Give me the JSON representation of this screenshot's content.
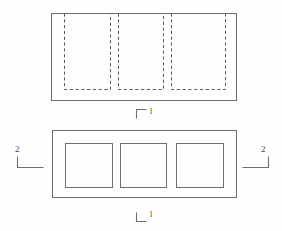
{
  "drawing": {
    "title": "Two-view technical drawing",
    "description": "Elevation view with three hidden (dashed) recesses above a plan view with three square openings",
    "stroke_color": "#6e6e6e",
    "hidden_stroke_color": "#5a5a5a",
    "label_color": "#4a4a4a",
    "background_color": "#fefefe",
    "line_width": 1,
    "views": [
      {
        "name": "elevation-view",
        "outline": {
          "x": 51,
          "y": 13,
          "width": 185,
          "height": 87
        },
        "hidden_features": [
          {
            "name": "hidden-recess-1",
            "x": 64,
            "y": 13,
            "width": 46,
            "height": 76
          },
          {
            "name": "hidden-recess-2",
            "x": 118,
            "y": 13,
            "width": 45,
            "height": 76
          },
          {
            "name": "hidden-recess-3",
            "x": 171,
            "y": 13,
            "width": 54,
            "height": 76
          }
        ]
      },
      {
        "name": "plan-view",
        "outline": {
          "x": 52,
          "y": 130,
          "width": 184,
          "height": 67
        },
        "openings": [
          {
            "name": "opening-1",
            "x": 65,
            "y": 143,
            "width": 47,
            "height": 44
          },
          {
            "name": "opening-2",
            "x": 120,
            "y": 143,
            "width": 46,
            "height": 44
          },
          {
            "name": "opening-3",
            "x": 176,
            "y": 143,
            "width": 47,
            "height": 44
          }
        ]
      }
    ],
    "section_markers": [
      {
        "name": "section-marker-1-top",
        "label": "1",
        "orientation": "top-left-bracket",
        "corner": {
          "x": 136,
          "y": 109
        },
        "arm_horizontal": 10,
        "arm_vertical": 9
      },
      {
        "name": "section-marker-1-bottom",
        "label": "1",
        "orientation": "bottom-left-bracket",
        "corner": {
          "x": 136,
          "y": 221
        },
        "arm_horizontal": 10,
        "arm_vertical": 9
      },
      {
        "name": "section-marker-2-left",
        "label": "2",
        "orientation": "bottom-left-bracket",
        "corner": {
          "x": 17,
          "y": 167
        },
        "arm_horizontal": 26,
        "arm_vertical": 11
      },
      {
        "name": "section-marker-2-right",
        "label": "2",
        "orientation": "bottom-right-bracket",
        "corner": {
          "x": 268,
          "y": 167
        },
        "arm_horizontal": 26,
        "arm_vertical": 11
      }
    ],
    "labels": {
      "section_1_top": "1",
      "section_1_bottom": "1",
      "section_2_left": "2",
      "section_2_right": "2"
    }
  }
}
